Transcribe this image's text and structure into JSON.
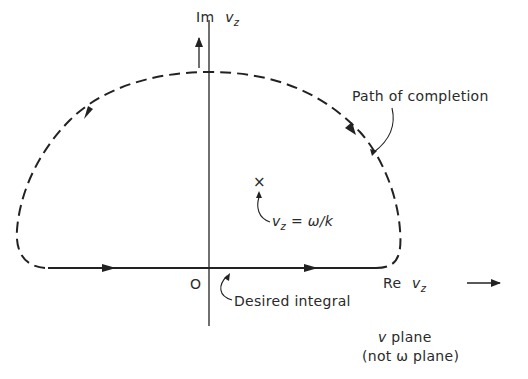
{
  "axes": {
    "imaginary_label": "Im",
    "imaginary_var": "v",
    "imaginary_sub": "z",
    "real_label": "Re",
    "real_var": "v",
    "real_sub": "z",
    "origin_label": "O"
  },
  "annotations": {
    "path_of_completion": "Path of completion",
    "pole_var": "v",
    "pole_sub": "z",
    "pole_rest": " = ω/k",
    "pole_marker": "×",
    "desired_integral": "Desired integral"
  },
  "plane_label": {
    "line1_var": "v",
    "line1_rest": " plane",
    "line2": "(not ω plane)"
  },
  "colors": {
    "stroke": "#222222",
    "background": "#ffffff"
  }
}
